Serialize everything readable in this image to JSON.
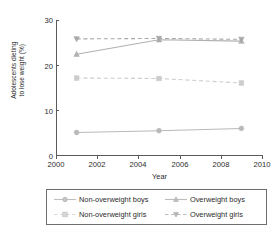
{
  "chart_data": {
    "type": "line",
    "title": "",
    "xlabel": "Year",
    "ylabel_line1": "Adolescents dieting",
    "ylabel_line2": "to lose weight (%)",
    "x": [
      2001,
      2005,
      2009
    ],
    "xlim": [
      2000,
      2010
    ],
    "ylim": [
      0,
      30
    ],
    "xticks": [
      2000,
      2002,
      2004,
      2006,
      2008,
      2010
    ],
    "yticks": [
      0,
      10,
      20,
      30
    ],
    "grid": false,
    "legend_position": "below",
    "series": [
      {
        "name": "Non-overweight boys",
        "values": [
          5.0,
          5.4,
          5.9
        ],
        "marker": "circle",
        "linestyle": "solid",
        "color": "#b9b9b9"
      },
      {
        "name": "Overweight boys",
        "values": [
          22.4,
          25.6,
          25.3
        ],
        "marker": "triangle-up",
        "linestyle": "solid",
        "color": "#b0b0b0"
      },
      {
        "name": "Non-overweight girls",
        "values": [
          17.1,
          17.0,
          16.0
        ],
        "marker": "square",
        "linestyle": "dashed",
        "color": "#cccccc"
      },
      {
        "name": "Overweight girls",
        "values": [
          25.8,
          25.9,
          25.7
        ],
        "marker": "triangle-down",
        "linestyle": "dashed",
        "color": "#a8a8a8"
      }
    ]
  },
  "axis": {
    "xticklabels": [
      "2000",
      "2002",
      "2004",
      "2006",
      "2008",
      "2010"
    ],
    "yticklabels": [
      "0",
      "10",
      "20",
      "30"
    ],
    "xlabel": "Year",
    "ylabel_line1": "Adolescents dieting",
    "ylabel_line2": "to lose weight (%)"
  },
  "legend": {
    "items": [
      {
        "label": "Non-overweight boys",
        "marker": "circle-marker",
        "linestyle": "solid"
      },
      {
        "label": "Overweight boys",
        "marker": "triangle-up-marker",
        "linestyle": "solid"
      },
      {
        "label": "Non-overweight girls",
        "marker": "square-marker",
        "linestyle": "dashed"
      },
      {
        "label": "Overweight girls",
        "marker": "triangle-down-marker",
        "linestyle": "dashed"
      }
    ]
  },
  "colors": {
    "axis": "#5a5a5a",
    "text": "#2b2b2b",
    "series_light": "#c6c6c6",
    "series_mid": "#b0b0b0",
    "background": "#ffffff"
  }
}
